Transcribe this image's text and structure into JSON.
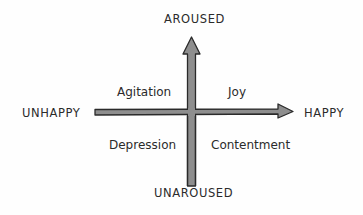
{
  "diagram": {
    "type": "two-axis emotion quadrant",
    "axes": {
      "vertical": {
        "top": "AROUSED",
        "bottom": "UNAROUSED"
      },
      "horizontal": {
        "left": "UNHAPPY",
        "right": "HAPPY"
      }
    },
    "quadrants": {
      "top_left": "Agitation",
      "top_right": "Joy",
      "bottom_left": "Depression",
      "bottom_right": "Contentment"
    },
    "colors": {
      "arrow_fill": "#8e8e8e",
      "arrow_outline": "#2a2a2a",
      "text": "#2b2b2b",
      "background": "#fefefe"
    }
  }
}
